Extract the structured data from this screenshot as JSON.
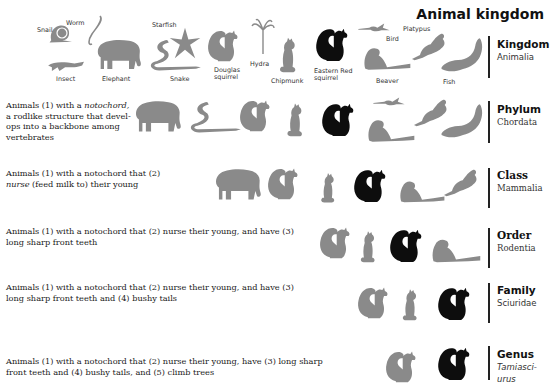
{
  "title": "Animal kingdom",
  "levels": [
    {
      "rank": "Kingdom",
      "taxon": "Animalia",
      "taxon_italic": false,
      "description": "",
      "animals": [
        "Snail",
        "Worm",
        "Insect",
        "Elephant",
        "Starfish",
        "Snake",
        "Douglas squirrel",
        "Hydra",
        "Chipmunk",
        "Eastern Red squirrel",
        "Beaver",
        "Bird",
        "Platypus",
        "Fish"
      ]
    },
    {
      "rank": "Phylum",
      "taxon": "Chordata",
      "taxon_italic": false,
      "description_parts": {
        "pre": "Animals (1) with a ",
        "em": "notochord,",
        "post": " a rodlike structure that devel-ops into a backbone among vertebrates"
      },
      "animals": [
        "Elephant",
        "Snake",
        "Douglas squirrel",
        "Chipmunk",
        "Eastern Red squirrel",
        "Beaver",
        "Bird",
        "Platypus",
        "Fish"
      ]
    },
    {
      "rank": "Class",
      "taxon": "Mammalia",
      "taxon_italic": false,
      "description_parts": {
        "pre": "Animals (1) with a notochord that (2) ",
        "em": "nurse",
        "post": " (feed milk to) their young"
      },
      "animals": [
        "Elephant",
        "Douglas squirrel",
        "Chipmunk",
        "Eastern Red squirrel",
        "Beaver",
        "Platypus"
      ]
    },
    {
      "rank": "Order",
      "taxon": "Rodentia",
      "taxon_italic": false,
      "description": "Animals (1) with a notochord that (2) nurse their young, and have (3) long sharp front teeth",
      "animals": [
        "Douglas squirrel",
        "Chipmunk",
        "Eastern Red squirrel",
        "Beaver"
      ]
    },
    {
      "rank": "Family",
      "taxon": "Sciuridae",
      "taxon_italic": false,
      "description": "Animals (1) with a notochord that (2) nurse their young, and have (3) long sharp front teeth and (4) bushy tails",
      "animals": [
        "Douglas squirrel",
        "Chipmunk",
        "Eastern Red squirrel"
      ]
    },
    {
      "rank": "Genus",
      "taxon": "Tamiasci-urus",
      "taxon_italic": true,
      "description": "Animals (1) with a notochord that (2) nurse their young, have (3) long sharp front teeth and (4) bushy tails, and (5) climb trees",
      "animals": [
        "Douglas squirrel",
        "Eastern Red squirrel"
      ]
    }
  ],
  "labels": {
    "snail": "Snail",
    "worm": "Worm",
    "insect": "Insect",
    "elephant": "Elephant",
    "starfish": "Starfish",
    "snake": "Snake",
    "douglas_1": "Douglas",
    "douglas_2": "squirrel",
    "hydra": "Hydra",
    "chipmunk": "Chipmunk",
    "eastern_1": "Eastern Red",
    "eastern_2": "squirrel",
    "beaver": "Beaver",
    "bird": "Bird",
    "platypus": "Platypus",
    "fish": "Fish"
  },
  "colors": {
    "gray_silhouette": "#8a8a8a",
    "black_silhouette": "#0d0d0d",
    "rank_bar": "#222222"
  }
}
